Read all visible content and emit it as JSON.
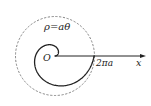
{
  "diagram": {
    "type": "archimedean-spiral",
    "equation_label": "ρ=aθ",
    "origin_label": "O",
    "radius_label": "2πa",
    "axis_label": "x",
    "spiral": {
      "a_px": 6.21,
      "theta_start": 0,
      "theta_end": 6.2832,
      "origin_px": [
        55,
        56
      ],
      "stroke": "#222222",
      "stroke_width": 1.3
    },
    "circle": {
      "center_px": [
        55,
        56
      ],
      "radius_px": 39.5,
      "style": "dashed",
      "stroke": "#777777"
    },
    "axis": {
      "from_px": [
        55,
        56
      ],
      "to_px": [
        146,
        56
      ],
      "stroke": "#222222"
    }
  }
}
